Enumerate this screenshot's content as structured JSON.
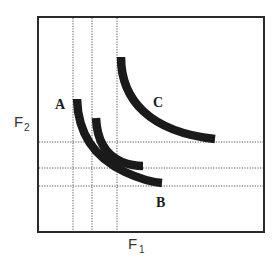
{
  "diagram": {
    "frame": {
      "x": 38,
      "y": 17,
      "width": 226,
      "height": 215
    },
    "axes": {
      "x_label": {
        "main": "F",
        "sub": "1"
      },
      "y_label": {
        "main": "F",
        "sub": "2"
      }
    },
    "guides": {
      "vertical_x": [
        73,
        92,
        117
      ],
      "horizontal_y": [
        142,
        168,
        186
      ]
    },
    "curves": [
      {
        "id": "A",
        "label": "A",
        "path": "M 77 99 C 78 135, 95 158, 125 172 C 138 178, 150 182, 162 183",
        "label_pos": {
          "x": 55,
          "y": 109
        }
      },
      {
        "id": "B",
        "label": "B",
        "path": "M 96 118 C 97 140, 105 155, 122 162 C 130 165, 136 166, 143 166",
        "label_pos": {
          "x": 156,
          "y": 207
        }
      },
      {
        "id": "C",
        "label": "C",
        "path": "M 121 57 C 121 100, 150 132, 215 139",
        "label_pos": {
          "x": 153,
          "y": 107
        }
      }
    ],
    "colors": {
      "background": "#ffffff",
      "curve": "#1a1a1a",
      "frame": "#2a2a2a",
      "guide": "#555555"
    }
  }
}
